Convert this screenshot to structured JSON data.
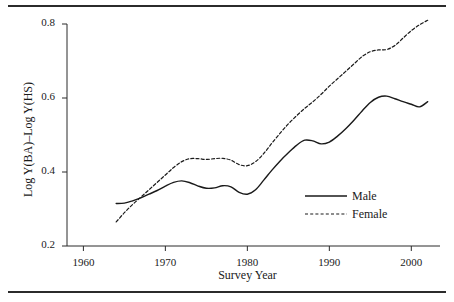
{
  "chart_data": {
    "type": "line",
    "title": "",
    "xlabel": "Survey Year",
    "ylabel": "Log Y(BA)–Log Y(HS)",
    "xlim": [
      1958,
      2003.5
    ],
    "ylim": [
      0.2,
      0.82
    ],
    "xticks": [
      1960,
      1970,
      1980,
      1990,
      2000
    ],
    "yticks": [
      0.2,
      0.4,
      0.6,
      0.8
    ],
    "xtick_labels": [
      "1960",
      "1970",
      "1980",
      "1990",
      "2000"
    ],
    "ytick_labels": [
      "0.2",
      "0.4",
      "0.6",
      "0.8"
    ],
    "grid": false,
    "legend_position": "center-right",
    "series": [
      {
        "name": "Male",
        "style": "solid",
        "color": "#1a1a1a",
        "x": [
          1964,
          1965,
          1966,
          1967,
          1968,
          1969,
          1970,
          1971,
          1972,
          1973,
          1974,
          1975,
          1976,
          1977,
          1978,
          1979,
          1980,
          1981,
          1982,
          1983,
          1984,
          1985,
          1986,
          1987,
          1988,
          1989,
          1990,
          1991,
          1992,
          1993,
          1994,
          1995,
          1996,
          1997,
          1998,
          1999,
          2000,
          2001,
          2002
        ],
        "values": [
          0.315,
          0.316,
          0.322,
          0.33,
          0.34,
          0.35,
          0.362,
          0.372,
          0.376,
          0.371,
          0.362,
          0.356,
          0.357,
          0.363,
          0.36,
          0.345,
          0.34,
          0.352,
          0.378,
          0.405,
          0.43,
          0.452,
          0.472,
          0.486,
          0.484,
          0.476,
          0.481,
          0.497,
          0.517,
          0.54,
          0.565,
          0.588,
          0.602,
          0.605,
          0.598,
          0.59,
          0.583,
          0.576,
          0.59
        ]
      },
      {
        "name": "Female",
        "style": "dashed",
        "color": "#1a1a1a",
        "x": [
          1964,
          1965,
          1966,
          1967,
          1968,
          1969,
          1970,
          1971,
          1972,
          1973,
          1974,
          1975,
          1976,
          1977,
          1978,
          1979,
          1980,
          1981,
          1982,
          1983,
          1984,
          1985,
          1986,
          1987,
          1988,
          1989,
          1990,
          1991,
          1992,
          1993,
          1994,
          1995,
          1996,
          1997,
          1998,
          1999,
          2000,
          2001,
          2002
        ],
        "values": [
          0.265,
          0.29,
          0.312,
          0.332,
          0.352,
          0.372,
          0.392,
          0.412,
          0.428,
          0.436,
          0.436,
          0.434,
          0.436,
          0.437,
          0.432,
          0.42,
          0.417,
          0.428,
          0.45,
          0.478,
          0.505,
          0.53,
          0.552,
          0.572,
          0.59,
          0.61,
          0.632,
          0.652,
          0.672,
          0.692,
          0.712,
          0.725,
          0.73,
          0.731,
          0.742,
          0.762,
          0.782,
          0.798,
          0.81
        ]
      }
    ]
  },
  "legend": {
    "items": [
      {
        "label": "Male"
      },
      {
        "label": "Female"
      }
    ]
  }
}
